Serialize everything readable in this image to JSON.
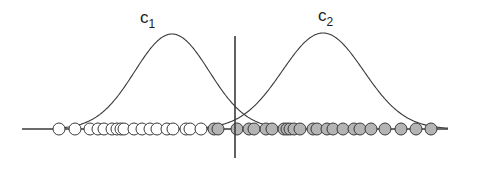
{
  "diagram": {
    "labels": {
      "class1": {
        "main": "c",
        "sub": "1"
      },
      "class2": {
        "main": "c",
        "sub": "2"
      }
    },
    "colors": {
      "line": "#3a3a3a",
      "circle_stroke": "#3a3a3a",
      "class1_fill": "#ffffff",
      "class2_fill": "#b4b4b4"
    },
    "axis": {
      "x1": 22,
      "x2": 448,
      "y": 129
    },
    "boundary": {
      "x": 235,
      "y1": 36,
      "y2": 158
    },
    "curves": {
      "class1": {
        "peak_x": 172,
        "peak_y": 34,
        "start_x": 64,
        "end_x": 295,
        "baseline_y": 129
      },
      "class2": {
        "peak_x": 323,
        "peak_y": 33,
        "start_x": 196,
        "end_x": 448,
        "baseline_y": 129
      }
    },
    "circle_radius": 6,
    "points": {
      "class1_x": [
        59,
        75,
        90,
        98,
        104,
        112,
        117,
        121,
        124,
        134,
        142,
        150,
        157,
        167,
        173,
        186,
        190,
        201
      ],
      "class2_x": [
        214,
        218,
        237,
        249,
        254,
        266,
        272,
        284,
        287,
        290,
        294,
        300,
        313,
        317,
        327,
        333,
        343,
        354,
        360,
        371,
        385,
        401,
        416,
        431
      ]
    }
  }
}
